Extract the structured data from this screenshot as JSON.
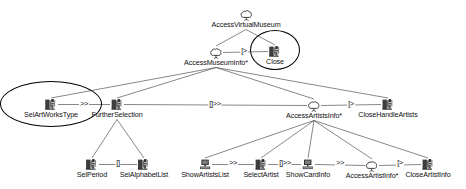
{
  "diagram": {
    "type": "concur-task-tree",
    "canvas": {
      "width": 466,
      "height": 189,
      "background": "#ffffff"
    },
    "nodes": [
      {
        "id": "accessVirtualMuseum",
        "label": "AccessVirtualMuseum",
        "icon": "abstract-task-cloud-icon",
        "x": 246,
        "y": 8,
        "label_dx": 0
      },
      {
        "id": "accessMuseumInfo",
        "label": "AccessMuseumInfo*",
        "icon": "abstract-task-cloud-icon",
        "x": 216,
        "y": 46,
        "label_dx": 0
      },
      {
        "id": "close",
        "label": "Close",
        "icon": "interaction-task-icon",
        "x": 275,
        "y": 45,
        "label_dx": 0
      },
      {
        "id": "selArtWorksType",
        "label": "SelArtWorksType",
        "icon": "interaction-task-icon",
        "x": 51,
        "y": 98,
        "label_dx": 0
      },
      {
        "id": "furtherSelection",
        "label": "FurtherSelection",
        "icon": "interaction-task-icon",
        "x": 117,
        "y": 98,
        "label_dx": 0
      },
      {
        "id": "accessArtistsInfo",
        "label": "AccessArtistsInfo*",
        "icon": "abstract-task-cloud-icon",
        "x": 314,
        "y": 99,
        "label_dx": 0
      },
      {
        "id": "closeHandleArtists",
        "label": "CloseHandleArtists",
        "icon": "interaction-task-icon",
        "x": 388,
        "y": 98,
        "label_dx": 0
      },
      {
        "id": "selPeriod",
        "label": "SelPeriod",
        "icon": "interaction-task-icon",
        "x": 92,
        "y": 158,
        "label_dx": 0
      },
      {
        "id": "selAlphabetList",
        "label": "SelAlphabetList",
        "icon": "interaction-task-icon",
        "x": 144,
        "y": 158,
        "label_dx": 0
      },
      {
        "id": "showArtistsList",
        "label": "ShowArtistsList",
        "icon": "application-task-icon",
        "x": 205,
        "y": 158,
        "label_dx": 0
      },
      {
        "id": "selectArtist",
        "label": "SelectArtist",
        "icon": "interaction-task-icon",
        "x": 261,
        "y": 158,
        "label_dx": 0
      },
      {
        "id": "showCardInfo",
        "label": "ShowCardInfo",
        "icon": "application-task-icon",
        "x": 308,
        "y": 158,
        "label_dx": 0
      },
      {
        "id": "accessArtistInfo",
        "label": "AccessArtistInfo*",
        "icon": "abstract-task-cloud-icon",
        "x": 372,
        "y": 159,
        "label_dx": 0
      },
      {
        "id": "closeArtistInfo",
        "label": "CloseArtistInfo",
        "icon": "interaction-task-icon",
        "x": 428,
        "y": 158,
        "label_dx": 0
      }
    ],
    "operators": [
      {
        "id": "op-close",
        "symbol": "[>",
        "x": 244,
        "y": 50,
        "name": "disabling-operator"
      },
      {
        "id": "op-selart-further",
        "symbol": ">>",
        "x": 84,
        "y": 103,
        "name": "enabling-operator"
      },
      {
        "id": "op-further-artists",
        "symbol": "[]>>",
        "x": 215,
        "y": 103,
        "name": "enabling-with-info-operator"
      },
      {
        "id": "op-artists-close",
        "symbol": "[>",
        "x": 351,
        "y": 103,
        "name": "disabling-operator"
      },
      {
        "id": "op-period-alpha",
        "symbol": "[]",
        "x": 118,
        "y": 162,
        "name": "choice-operator"
      },
      {
        "id": "op-list-select",
        "symbol": ">>",
        "x": 233,
        "y": 162,
        "name": "enabling-operator"
      },
      {
        "id": "op-select-card",
        "symbol": "[]>>",
        "x": 285,
        "y": 162,
        "name": "enabling-with-info-operator"
      },
      {
        "id": "op-card-artistinfo",
        "symbol": ">>",
        "x": 340,
        "y": 162,
        "name": "enabling-operator"
      },
      {
        "id": "op-artistinfo-close",
        "symbol": "[>",
        "x": 400,
        "y": 162,
        "name": "disabling-operator"
      }
    ],
    "edges": [
      {
        "from": "accessVirtualMuseum",
        "to": "accessMuseumInfo",
        "kind": "tree"
      },
      {
        "from": "accessVirtualMuseum",
        "to": "close",
        "kind": "tree"
      },
      {
        "from": "accessMuseumInfo",
        "to": "selArtWorksType",
        "kind": "tree"
      },
      {
        "from": "accessMuseumInfo",
        "to": "furtherSelection",
        "kind": "tree"
      },
      {
        "from": "accessMuseumInfo",
        "to": "accessArtistsInfo",
        "kind": "tree"
      },
      {
        "from": "accessMuseumInfo",
        "to": "closeHandleArtists",
        "kind": "tree"
      },
      {
        "from": "furtherSelection",
        "to": "selPeriod",
        "kind": "tree"
      },
      {
        "from": "furtherSelection",
        "to": "selAlphabetList",
        "kind": "tree"
      },
      {
        "from": "accessArtistsInfo",
        "to": "showArtistsList",
        "kind": "tree"
      },
      {
        "from": "accessArtistsInfo",
        "to": "selectArtist",
        "kind": "tree"
      },
      {
        "from": "accessArtistsInfo",
        "to": "showCardInfo",
        "kind": "tree"
      },
      {
        "from": "accessArtistsInfo",
        "to": "accessArtistInfo",
        "kind": "tree"
      },
      {
        "from": "accessArtistsInfo",
        "to": "closeArtistInfo",
        "kind": "tree"
      },
      {
        "from": "selArtWorksType",
        "to": "furtherSelection",
        "kind": "sibling"
      },
      {
        "from": "furtherSelection",
        "to": "accessArtistsInfo",
        "kind": "sibling"
      },
      {
        "from": "accessArtistsInfo",
        "to": "closeHandleArtists",
        "kind": "sibling"
      },
      {
        "from": "accessMuseumInfo",
        "to": "close",
        "kind": "sibling"
      },
      {
        "from": "selPeriod",
        "to": "selAlphabetList",
        "kind": "sibling"
      },
      {
        "from": "showArtistsList",
        "to": "selectArtist",
        "kind": "sibling"
      },
      {
        "from": "selectArtist",
        "to": "showCardInfo",
        "kind": "sibling"
      },
      {
        "from": "showCardInfo",
        "to": "accessArtistInfo",
        "kind": "sibling"
      },
      {
        "from": "accessArtistInfo",
        "to": "closeArtistInfo",
        "kind": "sibling"
      }
    ],
    "highlights": [
      {
        "id": "highlight-close",
        "target": "close",
        "shape": "ellipse",
        "cx": 275,
        "cy": 50,
        "rx": 24,
        "ry": 19,
        "color": "#000000"
      },
      {
        "id": "highlight-selartworkstype",
        "target": "selArtWorksType",
        "shape": "ellipse",
        "cx": 51,
        "cy": 104,
        "rx": 50,
        "ry": 22,
        "color": "#000000"
      }
    ],
    "colors": {
      "line": "#555555",
      "text": "#111111",
      "highlight": "#000000",
      "icon_dark": "#3a3a3a",
      "icon_mid": "#8a8a8a"
    }
  }
}
